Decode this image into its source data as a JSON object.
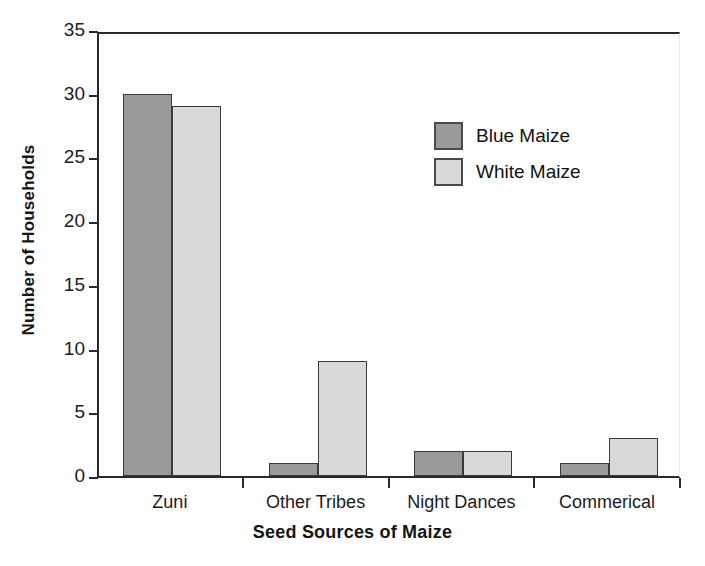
{
  "chart_data": {
    "type": "bar",
    "title": "",
    "xlabel": "Seed Sources of Maize",
    "ylabel": "Number of Households",
    "categories": [
      "Zuni",
      "Other Tribes",
      "Night Dances",
      "Commerical"
    ],
    "series": [
      {
        "name": "Blue Maize",
        "color": "#9a9a9a",
        "values": [
          30,
          1,
          2,
          1
        ]
      },
      {
        "name": "White Maize",
        "color": "#d9d9d9",
        "values": [
          29,
          9,
          2,
          3
        ]
      }
    ],
    "ylim": [
      0,
      35
    ],
    "ytick_values": [
      0,
      5,
      10,
      15,
      20,
      25,
      30,
      35
    ],
    "ytick_labels": [
      "0",
      "5",
      "10",
      "15",
      "20",
      "25",
      "30",
      "35"
    ],
    "grid": false,
    "legend_position": "upper-right-inside",
    "axis_color": "#2a2a2a",
    "background": "#ffffff"
  }
}
